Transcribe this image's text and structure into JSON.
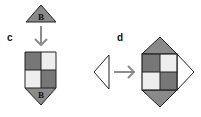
{
  "panels": [
    {
      "label": "c",
      "top_triangle_letter": "B",
      "bottom_triangle_letter": "B"
    },
    {
      "label": "d"
    }
  ],
  "colors": {
    "dark": "#777777",
    "light": "#eeeeee",
    "triangle": "#8a8a8a",
    "stroke": "#222222",
    "arrow": "#8c8c8c"
  }
}
